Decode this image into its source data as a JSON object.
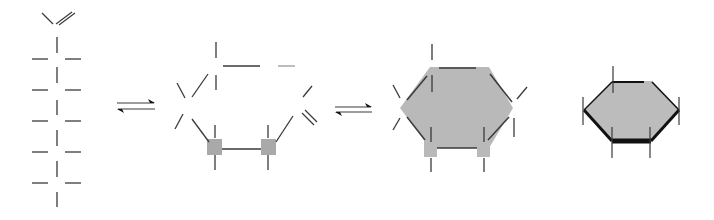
{
  "diagram": {
    "title": "",
    "colors": {
      "line": "#3a3a3a",
      "faint": "#9a9a9a",
      "fill": "#b9b9b9",
      "fill_ring4": "#bcbcbc",
      "square": "#a9a9a9",
      "bold": "#111111"
    },
    "panels": [
      {
        "id": "open-chain",
        "label": ""
      },
      {
        "id": "ring-closing",
        "label": ""
      },
      {
        "id": "ring-haworth",
        "label": ""
      },
      {
        "id": "ring-chair",
        "label": ""
      }
    ],
    "arrows": [
      {
        "id": "equilibrium-1",
        "top": [
          117,
          103,
          154
        ],
        "bottom": [
          118,
          109,
          155
        ]
      },
      {
        "id": "equilibrium-2",
        "top": [
          335,
          107,
          371
        ],
        "bottom": [
          336,
          112,
          372
        ]
      }
    ],
    "chain": {
      "x": 57,
      "top_v": {
        "left": [
          42,
          13,
          53,
          24
        ],
        "right_a": [
          56,
          24,
          72,
          12
        ],
        "right_b": [
          59,
          25,
          75,
          13
        ]
      },
      "verticals": [
        [
          37,
          53
        ],
        [
          67,
          83
        ],
        [
          100,
          115
        ],
        [
          130,
          146
        ],
        [
          161,
          177
        ],
        [
          192,
          207
        ]
      ],
      "rungs": [
        59,
        90,
        121,
        152,
        183
      ],
      "rung_left": [
        32,
        48
      ],
      "rung_right": [
        65,
        81
      ]
    },
    "ring2": {
      "lines": [
        [
          216,
          42,
          216,
          58
        ],
        [
          223,
          66,
          260,
          66
        ],
        [
          216,
          75,
          216,
          90
        ],
        [
          192,
          97,
          208,
          74
        ],
        [
          177,
          83,
          185,
          98
        ],
        [
          175,
          129,
          183,
          114
        ],
        [
          192,
          119,
          209,
          142
        ],
        [
          215,
          125,
          215,
          138
        ],
        [
          215,
          155,
          215,
          170
        ],
        [
          222,
          149,
          261,
          149
        ],
        [
          268,
          125,
          268,
          138
        ],
        [
          268,
          155,
          268,
          170
        ],
        [
          276,
          142,
          293,
          116
        ],
        [
          303,
          97,
          312,
          86
        ]
      ],
      "faint_lines": [
        [
          278,
          66,
          295,
          66
        ]
      ],
      "double": [
        [
          302,
          113,
          314,
          125
        ],
        [
          305,
          110,
          317,
          122
        ]
      ],
      "squares": [
        [
          207,
          139,
          15,
          16
        ],
        [
          261,
          139,
          15,
          16
        ]
      ]
    },
    "ring3": {
      "hexagon": [
        [
          430,
          67
        ],
        [
          489,
          67
        ],
        [
          513,
          108
        ],
        [
          489,
          148
        ],
        [
          430,
          148
        ],
        [
          400,
          108
        ]
      ],
      "squares": [
        [
          424,
          141,
          13,
          16
        ],
        [
          477,
          141,
          13,
          16
        ]
      ],
      "edges": [
        [
          439,
          68,
          476,
          68
        ],
        [
          407,
          100,
          427,
          76
        ],
        [
          490,
          74,
          512,
          102
        ],
        [
          407,
          117,
          425,
          140
        ],
        [
          437,
          148,
          477,
          148
        ],
        [
          488,
          140,
          509,
          117
        ]
      ],
      "sticks": [
        [
          432,
          44,
          432,
          60
        ],
        [
          432,
          75,
          432,
          92
        ],
        [
          393,
          85,
          400,
          98
        ],
        [
          517,
          99,
          527,
          87
        ],
        [
          393,
          130,
          400,
          118
        ],
        [
          514,
          118,
          514,
          137
        ],
        [
          431,
          127,
          431,
          142
        ],
        [
          431,
          158,
          431,
          172
        ],
        [
          484,
          127,
          484,
          142
        ],
        [
          484,
          158,
          484,
          172
        ]
      ]
    },
    "ring4": {
      "hexagon": [
        [
          612,
          81
        ],
        [
          652,
          81
        ],
        [
          679,
          110
        ],
        [
          651,
          141
        ],
        [
          612,
          141
        ],
        [
          584,
          110
        ]
      ],
      "edges": [
        {
          "p": [
            612,
            82,
            644,
            82
          ],
          "w": 2
        },
        {
          "p": [
            652,
            82,
            679,
            110
          ],
          "w": 1.5
        },
        {
          "p": [
            584,
            110,
            612,
            82
          ],
          "w": 1.5
        },
        {
          "p": [
            584,
            110,
            612,
            141
          ],
          "w": 3
        },
        {
          "p": [
            612,
            141,
            651,
            141
          ],
          "w": 5
        },
        {
          "p": [
            651,
            141,
            679,
            110
          ],
          "w": 3
        }
      ],
      "sticks": [
        [
          613,
          66,
          613,
          93
        ],
        [
          583,
          97,
          583,
          125
        ],
        [
          679,
          97,
          679,
          125
        ],
        [
          612,
          127,
          612,
          158
        ],
        [
          650,
          127,
          650,
          158
        ]
      ]
    }
  }
}
